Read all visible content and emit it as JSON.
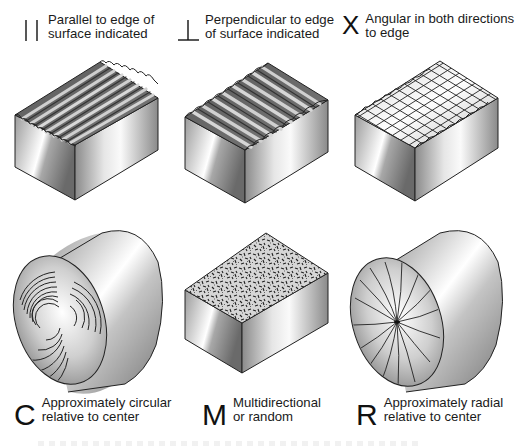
{
  "figure": {
    "topic": "Surface lay symbols",
    "items": [
      {
        "symbol": "=",
        "symbol_glyph": "| |",
        "description": "Parallel to edge of\nsurface indicated",
        "illustration": "block-parallel-grooves"
      },
      {
        "symbol": "⊥",
        "symbol_glyph": "⊥",
        "description": "Perpendicular to edge\nof surface indicated",
        "illustration": "block-perpendicular-grooves"
      },
      {
        "symbol": "X",
        "symbol_glyph": "X",
        "description": "Angular in both directions\nto edge",
        "illustration": "block-crosshatch"
      },
      {
        "symbol": "C",
        "symbol_glyph": "C",
        "description": "Approximately circular\nrelative to center",
        "illustration": "cylinder-circular-lay"
      },
      {
        "symbol": "M",
        "symbol_glyph": "M",
        "description": "Multidirectional\nor random",
        "illustration": "block-random-texture"
      },
      {
        "symbol": "R",
        "symbol_glyph": "R",
        "description": "Approximately radial\nrelative to center",
        "illustration": "cylinder-radial-lay"
      }
    ]
  },
  "colors": {
    "line": "#222222",
    "metal_light": "#f4f4f4",
    "metal_mid": "#bdbdbd",
    "metal_dark": "#6e6e6e",
    "groove_dark": "#4a4a4a"
  }
}
